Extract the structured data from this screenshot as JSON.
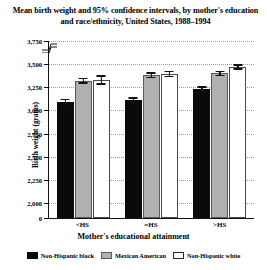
{
  "chart_data": {
    "type": "bar",
    "title": "Mean birth weight and 95% confidence intervals, by mother's education and race/ethnicity, United States, 1988–1994",
    "xlabel": "Mother's educational attainment",
    "ylabel": "Birth weight (grams)",
    "categories": [
      "<HS",
      "=HS",
      ">HS"
    ],
    "ylim": [
      2000,
      3750
    ],
    "y_axis_break": true,
    "y_zero_tick": "0",
    "ytick_labels": [
      "3,750",
      "3,500",
      "3,250",
      "3,000",
      "2,750",
      "2,500",
      "2,250",
      "2,000",
      "0"
    ],
    "ytick_values": [
      3750,
      3500,
      3250,
      3000,
      2750,
      2500,
      2250,
      2000,
      0
    ],
    "grid": true,
    "legend_position": "bottom",
    "series": [
      {
        "name": "Non-Hispanic black",
        "color": "#0a0a0a",
        "values": [
          3090,
          3110,
          3230
        ],
        "ci_low": [
          3055,
          3080,
          3200
        ],
        "ci_high": [
          3125,
          3140,
          3260
        ]
      },
      {
        "name": "Mexican American",
        "color": "#b0b0b0",
        "values": [
          3320,
          3380,
          3400
        ],
        "ci_low": [
          3290,
          3350,
          3370
        ],
        "ci_high": [
          3350,
          3410,
          3430
        ]
      },
      {
        "name": "Non-Hispanic white",
        "color": "#ffffff",
        "values": [
          3330,
          3395,
          3470
        ],
        "ci_low": [
          3280,
          3360,
          3440
        ],
        "ci_high": [
          3380,
          3430,
          3500
        ]
      }
    ]
  },
  "legend": {
    "items": [
      {
        "label": "Non-Hispanic black",
        "swatch": "black"
      },
      {
        "label": "Mexican American",
        "swatch": "gray"
      },
      {
        "label": "Non-Hispanic white",
        "swatch": "white"
      }
    ]
  }
}
